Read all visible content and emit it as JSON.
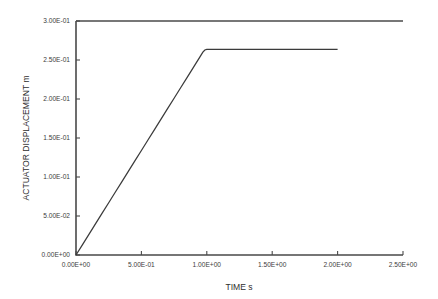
{
  "chart_data": {
    "type": "line",
    "title": "",
    "subtitle": "",
    "xlabel": "TIME s",
    "ylabel": "ACTUATOR DISPLACEMENT m",
    "xlim": [
      0.0,
      2.5
    ],
    "ylim": [
      0.0,
      0.3
    ],
    "grid": false,
    "legend": null,
    "legend_position": "none",
    "xticks": [
      0.0,
      0.5,
      1.0,
      1.5,
      2.0,
      2.5
    ],
    "xticklabels": [
      "0.00E+00",
      "5.00E-01",
      "1.00E+00",
      "1.50E+00",
      "2.00E+00",
      "2.50E+00"
    ],
    "yticks": [
      0.0,
      0.05,
      0.1,
      0.15,
      0.2,
      0.25,
      0.3
    ],
    "yticklabels": [
      "0.00E+00",
      "5.00E-02",
      "1.00E-01",
      "1.50E-01",
      "2.00E-01",
      "2.50E-01",
      "3.00E-01"
    ],
    "series": [
      {
        "name": "actuator displacement",
        "color": "#3b3b3b",
        "x": [
          0.0,
          0.05,
          0.1,
          0.15,
          0.2,
          0.25,
          0.3,
          0.35,
          0.4,
          0.45,
          0.5,
          0.55,
          0.6,
          0.65,
          0.7,
          0.75,
          0.8,
          0.85,
          0.9,
          0.95,
          0.97,
          0.985,
          1.0,
          1.05,
          1.1,
          1.2,
          1.3,
          1.4,
          1.5,
          1.6,
          1.7,
          1.8,
          1.9,
          2.0
        ],
        "y": [
          0.0,
          0.0134,
          0.0268,
          0.0402,
          0.0536,
          0.067,
          0.0804,
          0.0938,
          0.1072,
          0.1206,
          0.134,
          0.1474,
          0.1608,
          0.1742,
          0.1876,
          0.201,
          0.2144,
          0.2278,
          0.2412,
          0.2546,
          0.26,
          0.2628,
          0.2635,
          0.2635,
          0.2635,
          0.2635,
          0.2635,
          0.2635,
          0.2635,
          0.2635,
          0.2635,
          0.2635,
          0.2635,
          0.2635
        ]
      }
    ],
    "annotations": []
  },
  "axes": {
    "x_title": "TIME s",
    "y_title": "ACTUATOR DISPLACEMENT m"
  },
  "colors": {
    "background": "#ffffff",
    "axis": "#4a4a4a",
    "series": "#3b3b3b",
    "text": "#3c3c3c"
  }
}
